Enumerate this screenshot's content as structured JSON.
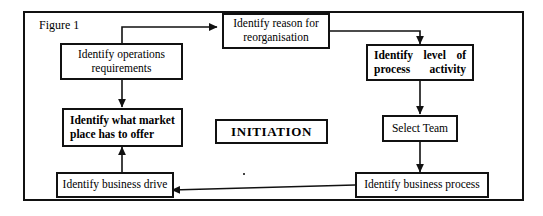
{
  "figure": {
    "label": "Figure 1"
  },
  "diagram": {
    "type": "flowchart",
    "title": "Figure 1",
    "center_label": "INITIATION",
    "nodes": [
      {
        "id": "operations-requirements",
        "label": "Identify operations requirements",
        "line1": "Identify operations",
        "line2": "requirements",
        "style": "regular",
        "align": "center"
      },
      {
        "id": "reason-reorganisation",
        "label": "Identify reason for reorganisation",
        "line1": "Identify reason for",
        "line2": "reorganisation",
        "style": "regular",
        "align": "center"
      },
      {
        "id": "level-process-activity",
        "label": "Identify level of process activity",
        "line1": "Identify level of",
        "line2": "process activity",
        "style": "bold",
        "align": "justify"
      },
      {
        "id": "market-place",
        "label": "Identify what market place has to offer",
        "line1": "Identify what market",
        "line2": "place has to offer",
        "style": "bold",
        "align": "left"
      },
      {
        "id": "select-team",
        "label": "Select Team",
        "line1": "Select Team",
        "line2": "",
        "style": "regular",
        "align": "center"
      },
      {
        "id": "business-drive",
        "label": "Identify business drive",
        "line1": "Identify business drive",
        "line2": "",
        "style": "regular",
        "align": "center"
      },
      {
        "id": "business-process",
        "label": "Identify business process",
        "line1": "Identify business process",
        "line2": "",
        "style": "regular",
        "align": "center"
      }
    ],
    "edges": [
      {
        "from": "operations-requirements",
        "to": "reason-reorganisation",
        "shape": "up-right"
      },
      {
        "from": "reason-reorganisation",
        "to": "level-process-activity",
        "shape": "right-down"
      },
      {
        "from": "operations-requirements",
        "to": "market-place",
        "shape": "down"
      },
      {
        "from": "level-process-activity",
        "to": "select-team",
        "shape": "down"
      },
      {
        "from": "select-team",
        "to": "business-process",
        "shape": "down"
      },
      {
        "from": "business-process",
        "to": "business-drive",
        "shape": "left"
      },
      {
        "from": "business-drive",
        "to": "market-place",
        "shape": "up"
      }
    ]
  },
  "colors": {
    "stroke": "#111111",
    "background": "#ffffff",
    "text": "#000000"
  }
}
